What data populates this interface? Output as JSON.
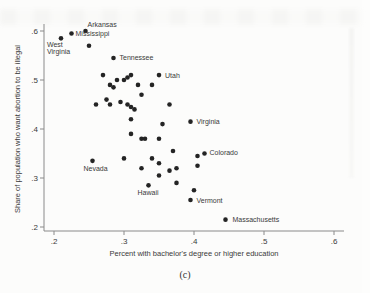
{
  "figure": {
    "caption": "(c)"
  },
  "chart_data": {
    "type": "scatter",
    "title": "",
    "xlabel": "Percent with bachelor's degree or higher education",
    "ylabel": "Share of population who want abortion to be illegal",
    "xlim": [
      0.2,
      0.6
    ],
    "ylim": [
      0.2,
      0.6
    ],
    "x_ticks": [
      ".2",
      ".3",
      ".4",
      ".5",
      ".6"
    ],
    "y_ticks": [
      ".2",
      ".3",
      ".4",
      ".5",
      ".6"
    ],
    "x_tick_values": [
      0.2,
      0.3,
      0.4,
      0.5,
      0.6
    ],
    "y_tick_values": [
      0.2,
      0.3,
      0.4,
      0.5,
      0.6
    ],
    "grid": false,
    "marker_color": "#242424",
    "axis_color": "#8a8a8a",
    "points": [
      {
        "x": 0.245,
        "y": 0.6,
        "label": "Arkansas",
        "dx": 2,
        "dy": -4,
        "anchor": "start"
      },
      {
        "x": 0.225,
        "y": 0.595,
        "label": "Mississippi",
        "dx": 4,
        "dy": 3,
        "anchor": "start"
      },
      {
        "x": 0.21,
        "y": 0.585,
        "label": "West Virginia",
        "lines": [
          "West",
          "Virginia"
        ],
        "dx": -14,
        "dy": 9,
        "anchor": "start"
      },
      {
        "x": 0.285,
        "y": 0.545,
        "label": "Tennessee",
        "dx": 6,
        "dy": 2.5,
        "anchor": "start"
      },
      {
        "x": 0.35,
        "y": 0.51,
        "label": "Utah",
        "dx": 6,
        "dy": 2.5,
        "anchor": "start"
      },
      {
        "x": 0.395,
        "y": 0.415,
        "label": "Virginia",
        "dx": 6,
        "dy": 2.5,
        "anchor": "start"
      },
      {
        "x": 0.415,
        "y": 0.35,
        "label": "Colorado",
        "dx": 5,
        "dy": 1.5,
        "anchor": "start"
      },
      {
        "x": 0.255,
        "y": 0.335,
        "label": "Nevada",
        "dx": -9,
        "dy": 10,
        "anchor": "start"
      },
      {
        "x": 0.335,
        "y": 0.285,
        "label": "Hawaii",
        "dx": -11,
        "dy": 10,
        "anchor": "start"
      },
      {
        "x": 0.395,
        "y": 0.255,
        "label": "Vermont",
        "dx": 6,
        "dy": 2.5,
        "anchor": "start"
      },
      {
        "x": 0.445,
        "y": 0.215,
        "label": "Massachusetts",
        "dx": 7,
        "dy": 2.5,
        "anchor": "start"
      },
      {
        "x": 0.25,
        "y": 0.57
      },
      {
        "x": 0.27,
        "y": 0.51
      },
      {
        "x": 0.29,
        "y": 0.5
      },
      {
        "x": 0.3,
        "y": 0.5
      },
      {
        "x": 0.305,
        "y": 0.505
      },
      {
        "x": 0.31,
        "y": 0.51
      },
      {
        "x": 0.28,
        "y": 0.49
      },
      {
        "x": 0.285,
        "y": 0.485
      },
      {
        "x": 0.32,
        "y": 0.49
      },
      {
        "x": 0.34,
        "y": 0.49
      },
      {
        "x": 0.325,
        "y": 0.47
      },
      {
        "x": 0.275,
        "y": 0.46
      },
      {
        "x": 0.26,
        "y": 0.45
      },
      {
        "x": 0.28,
        "y": 0.45
      },
      {
        "x": 0.295,
        "y": 0.455
      },
      {
        "x": 0.305,
        "y": 0.45
      },
      {
        "x": 0.31,
        "y": 0.445
      },
      {
        "x": 0.315,
        "y": 0.44
      },
      {
        "x": 0.365,
        "y": 0.45
      },
      {
        "x": 0.31,
        "y": 0.42
      },
      {
        "x": 0.355,
        "y": 0.41
      },
      {
        "x": 0.31,
        "y": 0.39
      },
      {
        "x": 0.325,
        "y": 0.38
      },
      {
        "x": 0.33,
        "y": 0.38
      },
      {
        "x": 0.35,
        "y": 0.38
      },
      {
        "x": 0.37,
        "y": 0.355
      },
      {
        "x": 0.405,
        "y": 0.345
      },
      {
        "x": 0.3,
        "y": 0.34
      },
      {
        "x": 0.34,
        "y": 0.34
      },
      {
        "x": 0.325,
        "y": 0.32
      },
      {
        "x": 0.35,
        "y": 0.33
      },
      {
        "x": 0.365,
        "y": 0.315
      },
      {
        "x": 0.375,
        "y": 0.32
      },
      {
        "x": 0.405,
        "y": 0.325
      },
      {
        "x": 0.35,
        "y": 0.305
      },
      {
        "x": 0.375,
        "y": 0.29
      },
      {
        "x": 0.4,
        "y": 0.275
      }
    ]
  }
}
